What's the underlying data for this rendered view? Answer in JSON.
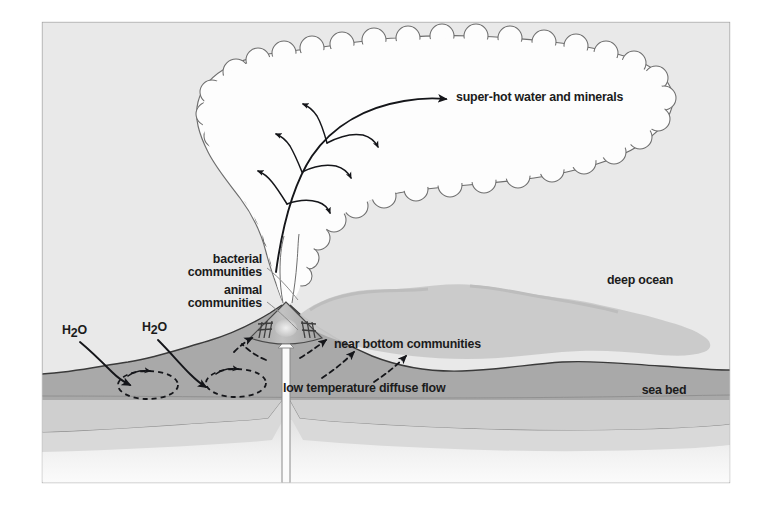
{
  "figure": {
    "type": "scientific-diagram",
    "background_color": "#ffffff",
    "frame": {
      "border_color": "#9a9a9a",
      "fill_color": "#e9e9e9",
      "x": 42,
      "y": 22,
      "width": 688,
      "height": 461
    }
  },
  "palette": {
    "page_background": "#ffffff",
    "ocean_water": "#e9e9e9",
    "plume_cloud_white": "#fdfdfd",
    "plume_cloud_outline": "#6e6e6e",
    "drift_plume_grey": "#c9c9c9",
    "seabed_upper": "#a9a9a9",
    "seabed_mid": "#d2d2d2",
    "crust_light": "#efefef",
    "vent_cone": "#b4b4b4",
    "text_color": "#1b1b1b",
    "arrow_color": "#15161a",
    "leader_line_color": "#8d8d8d"
  },
  "labels": {
    "super_hot": {
      "text": "super-hot water and minerals",
      "x": 456,
      "y": 101,
      "anchor": "start",
      "role": "plume-outflow-label"
    },
    "bacterial_line1": {
      "text": "bacterial",
      "x": 262,
      "y": 263,
      "anchor": "end"
    },
    "bacterial_line2": {
      "text": "communities",
      "x": 262,
      "y": 276,
      "anchor": "end"
    },
    "animal_line1": {
      "text": "animal",
      "x": 262,
      "y": 294,
      "anchor": "end"
    },
    "animal_line2": {
      "text": "communities",
      "x": 262,
      "y": 307,
      "anchor": "end"
    },
    "h2o_left": {
      "text_main": "H",
      "text_sub": "2",
      "text_tail": "O",
      "x": 68,
      "y": 334
    },
    "h2o_right": {
      "text_main": "H",
      "text_sub": "2",
      "text_tail": "O",
      "x": 148,
      "y": 331
    },
    "near_bottom": {
      "text": "near bottom communities",
      "x": 334,
      "y": 348,
      "anchor": "start"
    },
    "low_temp": {
      "text": "low temperature diffuse flow",
      "x": 283,
      "y": 392,
      "anchor": "start"
    },
    "deep_ocean": {
      "text": "deep ocean",
      "x": 640,
      "y": 284,
      "anchor": "middle"
    },
    "sea_bed": {
      "text": "sea bed",
      "x": 664,
      "y": 394,
      "anchor": "middle"
    }
  },
  "features": [
    {
      "name": "black-smoker-chimney",
      "description": "conical vent mound at center emitting a vertical smoke column"
    },
    {
      "name": "buoyant-plume-cloud",
      "description": "large white scalloped cloud of super-hot water and minerals rising and spreading right"
    },
    {
      "name": "neutrally-buoyant-drift-plume",
      "description": "grey scalloped plume drifting to the right above the sea bed"
    },
    {
      "name": "hydrothermal-circulation-loops",
      "description": "two dashed elliptical convection cells inside the sea bed"
    },
    {
      "name": "tube-worm-colonies",
      "description": "hatched animal community clusters flanking the vent cone"
    }
  ]
}
